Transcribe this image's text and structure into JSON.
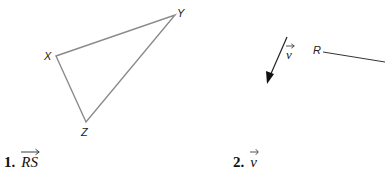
{
  "figure_left": {
    "type": "triangle",
    "vertices": {
      "X": {
        "label": "X",
        "x": 56,
        "y": 56
      },
      "Y": {
        "label": "Y",
        "x": 175,
        "y": 15
      },
      "Z": {
        "label": "Z",
        "x": 86,
        "y": 122
      }
    },
    "stroke_color": "#8a8a8a"
  },
  "figure_right": {
    "vector": {
      "label": "v",
      "from": [
        287,
        37
      ],
      "to": [
        267,
        83
      ]
    },
    "ray": {
      "label": "R",
      "from": [
        323,
        52
      ],
      "to": [
        385,
        62
      ]
    },
    "stroke_color": "#222222"
  },
  "problems": [
    {
      "number": "1.",
      "expression": "RS"
    },
    {
      "number": "2.",
      "expression": "v"
    }
  ]
}
